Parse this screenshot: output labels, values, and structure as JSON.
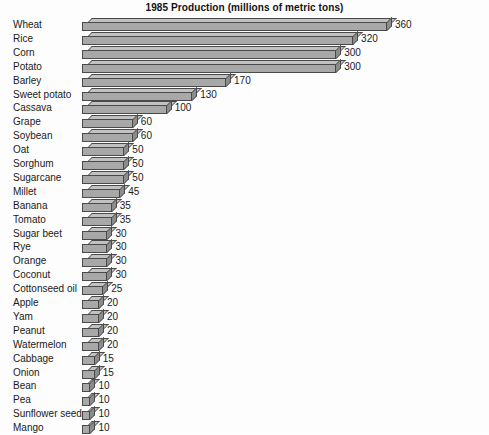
{
  "chart_data": {
    "type": "bar",
    "orientation": "horizontal",
    "style": "3d-extruded",
    "title": "1985 Production (millions of metric tons)",
    "xlabel": "",
    "ylabel": "",
    "xlim": [
      0,
      360
    ],
    "grid": false,
    "legend": null,
    "value_labels_shown": true,
    "units": "millions of metric tons",
    "year": "1985",
    "categories": [
      "Wheat",
      "Rice",
      "Corn",
      "Potato",
      "Barley",
      "Sweet potato",
      "Cassava",
      "Grape",
      "Soybean",
      "Oat",
      "Sorghum",
      "Sugarcane",
      "Millet",
      "Banana",
      "Tomato",
      "Sugar beet",
      "Rye",
      "Orange",
      "Coconut",
      "Cottonseed oil",
      "Apple",
      "Yam",
      "Peanut",
      "Watermelon",
      "Cabbage",
      "Onion",
      "Bean",
      "Pea",
      "Sunflower seed",
      "Mango"
    ],
    "values": [
      360,
      320,
      300,
      300,
      170,
      130,
      100,
      60,
      60,
      50,
      50,
      50,
      45,
      35,
      35,
      30,
      30,
      30,
      30,
      25,
      20,
      20,
      20,
      20,
      15,
      15,
      10,
      10,
      10,
      10
    ],
    "value_label_text": [
      "360",
      "320",
      "300",
      "300",
      "170",
      "130",
      "100",
      "60",
      "60",
      "50",
      "50",
      "50",
      "45",
      "35",
      "35",
      "30",
      "30",
      "30",
      "30",
      "25",
      "20",
      "20",
      "20",
      "20",
      "15",
      "15",
      "10",
      "10",
      "10",
      "10"
    ],
    "colors": {
      "bar_front": "#a8a8a8",
      "bar_top": "#c2c2c2",
      "bar_side": "#8c8c8c",
      "bar_outline": "#4a4a4a",
      "text": "#1a1a1a",
      "background": "#fdfdfd"
    }
  }
}
